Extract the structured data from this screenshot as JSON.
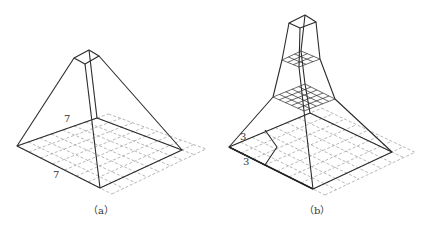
{
  "figure": {
    "panels": [
      {
        "id": "a",
        "caption": "（a）",
        "description": "Pyramid with 7x7 base region converging to single top cell",
        "labels": [
          {
            "text": "7",
            "role": "top-left edge length"
          },
          {
            "text": "7",
            "role": "bottom-left edge length"
          }
        ],
        "base_grid": 7,
        "layers": 1
      },
      {
        "id": "b",
        "caption": "（b）",
        "description": "Stacked multi-layer pyramid: 3x3 neighbourhoods reduce 7x7 -> 5x5 -> 3x3 -> 1x1",
        "labels": [
          {
            "text": "3",
            "role": "top-left edge length"
          },
          {
            "text": "3",
            "role": "bottom-left edge length"
          }
        ],
        "layer_grids": [
          7,
          5,
          3,
          1
        ]
      }
    ],
    "colors": {
      "line": "#2b2b2b",
      "dashed_grid": "#8a8a8a",
      "background": "#ffffff"
    }
  }
}
